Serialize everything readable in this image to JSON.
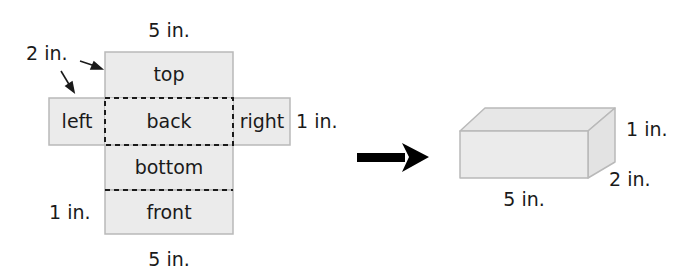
{
  "net": {
    "faces": {
      "top": "top",
      "left": "left",
      "back": "back",
      "right": "right",
      "bottom": "bottom",
      "front": "front"
    },
    "dimensions": {
      "top_width": "5 in.",
      "fold_height": "2 in.",
      "right_side": "1 in.",
      "front_height": "1 in.",
      "bottom_width": "5 in."
    }
  },
  "prism": {
    "dimensions": {
      "length": "5 in.",
      "height": "1 in.",
      "depth": "2 in."
    }
  },
  "colors": {
    "face_fill": "#ebebeb",
    "face_stroke": "#b9b9b9",
    "dash": "#1a1a1a",
    "arrow": "#000000"
  }
}
